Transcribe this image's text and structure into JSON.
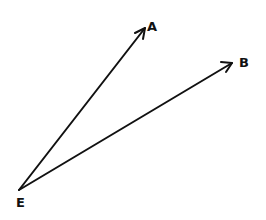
{
  "diagram": {
    "type": "vector-diagram",
    "stroke_color": "#111111",
    "background": "#ffffff",
    "origin": {
      "label": "E",
      "x": 19,
      "y": 190
    },
    "vectors": [
      {
        "id": "EA",
        "from": "E",
        "to": "A",
        "label": "A",
        "tip": {
          "x": 145,
          "y": 28
        }
      },
      {
        "id": "EB",
        "from": "E",
        "to": "B",
        "label": "B",
        "tip": {
          "x": 232,
          "y": 63
        }
      }
    ],
    "labels": {
      "a": "A",
      "b": "B",
      "e": "E"
    }
  }
}
